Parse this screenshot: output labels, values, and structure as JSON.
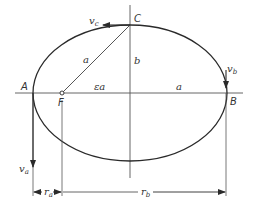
{
  "diagram": {
    "type": "orbital-ellipse",
    "colors": {
      "stroke": "#2a2a2a",
      "thin_stroke": "#555555",
      "text": "#333333",
      "background": "#ffffff"
    },
    "geometry": {
      "center": [
        130,
        93
      ],
      "semi_major_a": 97,
      "semi_minor_b": 68,
      "focus_F": [
        62,
        93
      ],
      "A": [
        33,
        93
      ],
      "B": [
        226,
        93
      ],
      "C": [
        130,
        25
      ]
    },
    "points": {
      "A": "A",
      "B": "B",
      "C": "C",
      "F": "F"
    },
    "segments": {
      "a_slant": "a",
      "b": "b",
      "a_horizontal": "a",
      "ea": "εa"
    },
    "velocities": {
      "vc_main": "v",
      "vc_sub": "c",
      "vb_main": "v",
      "vb_sub": "b",
      "va_main": "v",
      "va_sub": "a"
    },
    "dimensions": {
      "ra_main": "r",
      "ra_sub": "a",
      "rb_main": "r",
      "rb_sub": "b"
    }
  }
}
